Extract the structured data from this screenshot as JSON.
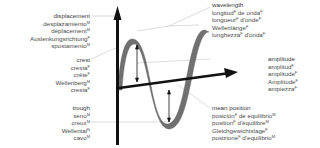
{
  "diagram": {
    "colors": {
      "wave": "#6f6f6f",
      "axis": "#111111",
      "leader": "#bdbdbd",
      "text": "#4a4a4a"
    },
    "labels": {
      "displacement": {
        "lines": [
          {
            "text": "displacement",
            "gender": ""
          },
          {
            "text": "desplazamiento",
            "gender": "M"
          },
          {
            "text": "déplacement",
            "gender": "M"
          },
          {
            "text": "Auslenkungsrichtung",
            "gender": "F"
          },
          {
            "text": "spostamento",
            "gender": "M"
          }
        ]
      },
      "crest": {
        "lines": [
          {
            "text": "crest",
            "gender": ""
          },
          {
            "text": "cresta",
            "gender": "F"
          },
          {
            "text": "crête",
            "gender": "F"
          },
          {
            "text": "Wellenberg",
            "gender": "M"
          },
          {
            "text": "cresta",
            "gender": "F"
          }
        ]
      },
      "trough": {
        "lines": [
          {
            "text": "trough",
            "gender": ""
          },
          {
            "text": "seno",
            "gender": "M"
          },
          {
            "text": "creux",
            "gender": "M"
          },
          {
            "text": "Wellental",
            "gender": "N"
          },
          {
            "text": "cavo",
            "gender": "M"
          }
        ]
      },
      "wavelength": {
        "lines": [
          {
            "text": "wavelength",
            "gender": ""
          },
          {
            "text": "longitud",
            "gender": "F",
            "suffix": " de onda",
            "suffix_gender": "F"
          },
          {
            "text": "longueur",
            "gender": "F",
            "suffix": " d'onde",
            "suffix_gender": "F"
          },
          {
            "text": "Wellenlänge",
            "gender": "F"
          },
          {
            "text": "lunghezza",
            "gender": "F",
            "suffix": " d'onda",
            "suffix_gender": "F"
          }
        ]
      },
      "amplitude": {
        "lines": [
          {
            "text": "amplitude",
            "gender": ""
          },
          {
            "text": "amplitud",
            "gender": "F"
          },
          {
            "text": "amplitude",
            "gender": "F"
          },
          {
            "text": "Amplitude",
            "gender": "F"
          },
          {
            "text": "ampiezza",
            "gender": "F"
          }
        ]
      },
      "mean_position": {
        "lines": [
          {
            "text": "mean position",
            "gender": ""
          },
          {
            "text": "posición",
            "gender": "F",
            "suffix": " de equilibrio",
            "suffix_gender": "M"
          },
          {
            "text": "position",
            "gender": "F",
            "suffix": " d'équilibre",
            "suffix_gender": "M"
          },
          {
            "text": "Gleichgewichtslage",
            "gender": "F"
          },
          {
            "text": "posizione",
            "gender": "F",
            "suffix": " d'equilibrio",
            "suffix_gender": "M"
          }
        ]
      }
    }
  }
}
